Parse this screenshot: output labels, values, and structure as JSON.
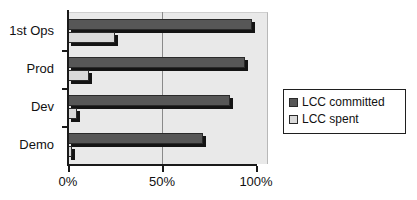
{
  "chart_data": {
    "type": "bar",
    "orientation": "horizontal",
    "title": "",
    "xlabel": "",
    "ylabel": "",
    "categories": [
      "1st Ops",
      "Prod",
      "Dev",
      "Demo"
    ],
    "series": [
      {
        "name": "LCC committed",
        "color": "#575757",
        "values": [
          98,
          94,
          86,
          72
        ]
      },
      {
        "name": "LCC spent",
        "color": "#d9d9d9",
        "values": [
          25,
          11,
          5,
          2
        ]
      }
    ],
    "xlim": [
      0,
      100
    ],
    "xticks": [
      0,
      50,
      100
    ],
    "xtick_labels": [
      "0%",
      "50%",
      "100%"
    ],
    "grid": "vertical-at-50",
    "legend_position": "right",
    "legend_entries": [
      "LCC committed",
      "LCC spent"
    ],
    "plot_background": "#e9e9e9",
    "axis_color": "#1a1a1a"
  },
  "legend": {
    "items": [
      {
        "label": "LCC committed",
        "swatch": "committed"
      },
      {
        "label": "LCC spent",
        "swatch": "spent"
      }
    ]
  }
}
